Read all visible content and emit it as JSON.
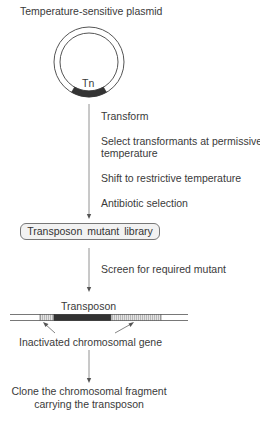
{
  "diagram": {
    "title": "Temperature-sensitive plasmid",
    "plasmid": {
      "insert_label": "Tn"
    },
    "steps_phase1": [
      "Transform",
      "Select transformants at permissive",
      "temperature",
      "Shift to restrictive temperature",
      "Antibiotic selection"
    ],
    "library_label": "Transposon  mutant  library",
    "step_phase2": "Screen for required mutant",
    "chromosome": {
      "transposon_label": "Transposon",
      "gene_label": "Inactivated chromosomal gene"
    },
    "final_step": {
      "line1": "Clone the chromosomal fragment",
      "line2": "carrying the transposon"
    },
    "colors": {
      "line": "#666666",
      "transposon": "#333333",
      "hatched": "#d8d8d8",
      "box_fill": "#f2f2f2"
    }
  }
}
